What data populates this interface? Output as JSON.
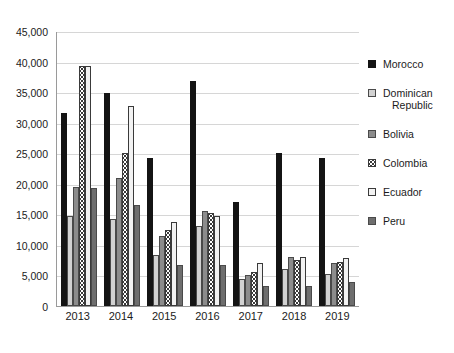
{
  "chart_data": {
    "type": "bar",
    "title": "",
    "subtitle": "",
    "xlabel": "",
    "ylabel": "",
    "categories": [
      "2013",
      "2014",
      "2015",
      "2016",
      "2017",
      "2018",
      "2019"
    ],
    "ylim": [
      0,
      45000
    ],
    "ytick_values": [
      0,
      5000,
      10000,
      15000,
      20000,
      25000,
      30000,
      35000,
      40000,
      45000
    ],
    "ytick_labels": [
      "0",
      "5,000",
      "10,000",
      "15,000",
      "20,000",
      "25,000",
      "30,000",
      "35,000",
      "40,000",
      "45,000"
    ],
    "grid": true,
    "legend_position": "right",
    "series": [
      {
        "name": "Morocco",
        "color": "#141414",
        "pattern": "solid-black",
        "values": [
          31600,
          34800,
          24200,
          36800,
          17100,
          25100,
          24300
        ]
      },
      {
        "name": "Dominican Republic",
        "color": "#d2d2d2",
        "pattern": "light-gray",
        "values": [
          14700,
          14300,
          8300,
          13100,
          4400,
          6100,
          5300
        ]
      },
      {
        "name": "Bolivia",
        "color": "#8c8c8c",
        "pattern": "mid-gray",
        "values": [
          19400,
          20900,
          11500,
          15600,
          5100,
          8100,
          7100
        ]
      },
      {
        "name": "Colombia",
        "color": "#ffffff",
        "pattern": "dotted-white",
        "values": [
          39200,
          25100,
          12400,
          15200,
          5600,
          7500,
          7200
        ]
      },
      {
        "name": "Ecuador",
        "color": "#f2f2f2",
        "pattern": "white",
        "values": [
          39200,
          32700,
          13800,
          14700,
          7000,
          8000,
          7800
        ]
      },
      {
        "name": "Peru",
        "color": "#6e6e6e",
        "pattern": "dark-gray",
        "values": [
          19300,
          16600,
          6700,
          6700,
          3300,
          3300,
          3900
        ]
      }
    ]
  },
  "legend": {
    "items": [
      {
        "label": "Morocco",
        "label_line1": "Morocco",
        "label_line2": ""
      },
      {
        "label": "Dominican Republic",
        "label_line1": "Dominican",
        "label_line2": "Republic"
      },
      {
        "label": "Bolivia",
        "label_line1": "Bolivia",
        "label_line2": ""
      },
      {
        "label": "Colombia",
        "label_line1": "Colombia",
        "label_line2": ""
      },
      {
        "label": "Ecuador",
        "label_line1": "Ecuador",
        "label_line2": ""
      },
      {
        "label": "Peru",
        "label_line1": "Peru",
        "label_line2": ""
      }
    ]
  }
}
